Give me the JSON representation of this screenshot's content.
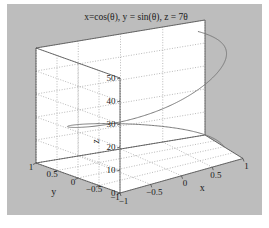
{
  "figure": {
    "background_color": "#bdbdbd",
    "page_color": "#ffffff",
    "wall_color": "#ffffff",
    "grid_color": "#8c8c8c",
    "line_color": "#7a7a7a",
    "axis_color": "#4d4d4d"
  },
  "chart_data": {
    "type": "line",
    "title": "x=cos(θ), y = sin(θ), z = 7θ",
    "subtitle": "",
    "projection": "3d",
    "xlabel": "x",
    "ylabel": "y",
    "zlabel": "z",
    "xlim": [
      -1,
      1
    ],
    "ylim": [
      -1,
      1
    ],
    "zlim": [
      0,
      50
    ],
    "xticks": [
      "-1",
      "-0.5",
      "0",
      "0.5",
      "1"
    ],
    "yticks": [
      "1",
      "0.5",
      "0",
      "-0.5",
      "-1"
    ],
    "zticks": [
      "0",
      "10",
      "20",
      "30",
      "40",
      "50"
    ],
    "xtick_values": [
      -1,
      -0.5,
      0,
      0.5,
      1
    ],
    "ytick_values": [
      1,
      0.5,
      0,
      -0.5,
      -1
    ],
    "ztick_values": [
      0,
      10,
      20,
      30,
      40,
      50
    ],
    "grid": true,
    "grid_style": "dotted",
    "legend": null,
    "series": [
      {
        "name": "helix",
        "parametric": true,
        "parameter": "theta",
        "theta_start": 0,
        "theta_end": 6.9,
        "x_expr": "cos(theta)",
        "y_expr": "sin(theta)",
        "z_expr": "7*theta",
        "color": "#7a7a7a",
        "width": 1
      }
    ]
  }
}
